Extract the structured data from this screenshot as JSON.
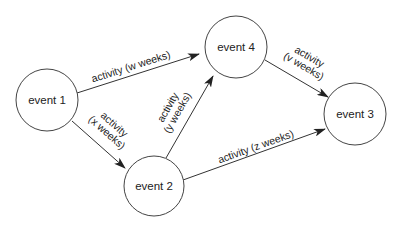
{
  "diagram": {
    "type": "activity-on-arrow network",
    "nodes": [
      {
        "id": "event1",
        "label": "event 1",
        "cx": 47,
        "cy": 100,
        "r": 31
      },
      {
        "id": "event2",
        "label": "event 2",
        "cx": 154,
        "cy": 186,
        "r": 30
      },
      {
        "id": "event4",
        "label": "event 4",
        "cx": 236,
        "cy": 47,
        "r": 31
      },
      {
        "id": "event3",
        "label": "event 3",
        "cx": 355,
        "cy": 114,
        "r": 31
      }
    ],
    "edges": [
      {
        "id": "w",
        "from": "event 1",
        "to": "event 4",
        "label_lines": [
          "activity (w weeks)"
        ]
      },
      {
        "id": "x",
        "from": "event 1",
        "to": "event 2",
        "label_lines": [
          "activity",
          "(x weeks)"
        ]
      },
      {
        "id": "y",
        "from": "event 2",
        "to": "event 4",
        "label_lines": [
          "activity",
          "(y weeks)"
        ]
      },
      {
        "id": "v",
        "from": "event 4",
        "to": "event 3",
        "label_lines": [
          "activity",
          "(v weeks)"
        ]
      },
      {
        "id": "z",
        "from": "event 2",
        "to": "event 3",
        "label_lines": [
          "activity (z weeks)"
        ]
      }
    ]
  }
}
